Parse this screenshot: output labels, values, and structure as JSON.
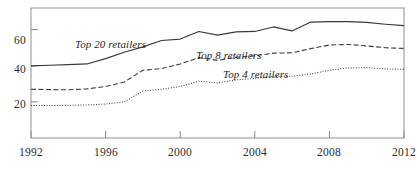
{
  "chart_data": {
    "type": "line",
    "title": "",
    "xlabel": "",
    "ylabel": "",
    "xlim": [
      1992,
      2012
    ],
    "ylim": [
      0,
      72
    ],
    "grid": false,
    "legend_position": "inline-labels",
    "xticks": [
      "1992",
      "1996",
      "2000",
      "2004",
      "2008",
      "2012"
    ],
    "xtick_values": [
      1992,
      1996,
      2000,
      2004,
      2008,
      2012
    ],
    "yticks": [
      "20",
      "40",
      "60"
    ],
    "ytick_values": [
      20,
      40,
      60
    ],
    "x": [
      1992,
      1993,
      1994,
      1995,
      1996,
      1997,
      1998,
      1999,
      2000,
      2001,
      2002,
      2003,
      2004,
      2005,
      2006,
      2007,
      2008,
      2009,
      2010,
      2011,
      2012
    ],
    "series": [
      {
        "name": "Top 20 retailers",
        "label": "Top 20 retailers",
        "style": "solid",
        "color": "#3a3a3a",
        "values": [
          40.0,
          40.3,
          40.6,
          41.0,
          44.0,
          47.5,
          50.5,
          54.0,
          54.8,
          59.0,
          57.0,
          58.8,
          59.0,
          61.5,
          59.3,
          64.2,
          64.4,
          64.5,
          64.0,
          63.0,
          62.2
        ]
      },
      {
        "name": "Top 8 retailers",
        "label": "Top 8 retailers",
        "style": "dashed",
        "color": "#3a3a3a",
        "values": [
          27.0,
          26.8,
          26.7,
          27.2,
          28.5,
          31.0,
          37.5,
          38.5,
          41.0,
          44.5,
          43.0,
          44.7,
          45.5,
          47.0,
          47.2,
          49.5,
          51.5,
          51.8,
          51.0,
          50.0,
          49.6
        ]
      },
      {
        "name": "Top 4 retailers",
        "label": "Top 4 retailers",
        "style": "dotted",
        "color": "#4a4a4a",
        "values": [
          18.0,
          18.0,
          18.1,
          18.3,
          18.8,
          20.0,
          26.0,
          27.0,
          28.5,
          31.5,
          30.5,
          32.2,
          33.0,
          34.0,
          34.2,
          35.5,
          37.5,
          38.8,
          39.0,
          38.3,
          38.0
        ]
      }
    ],
    "annotations": [
      {
        "text": "Top 20 retailers",
        "x": 1996.0,
        "y": 52.0
      },
      {
        "text": "Top 8 retailers",
        "x": 2002.0,
        "y": 47.0
      },
      {
        "text": "Top 4 retailers",
        "x": 2004.4,
        "y": 38.5
      }
    ]
  },
  "axes": {
    "frame_color": "#8a8a8a",
    "tick_color": "#8a8a8a"
  }
}
